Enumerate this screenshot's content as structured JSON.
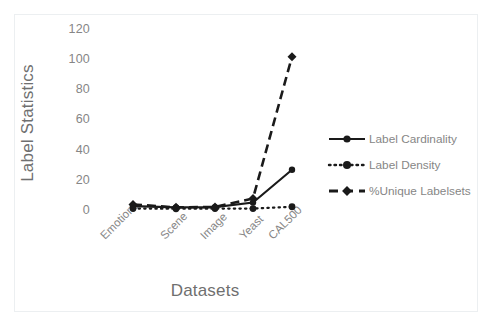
{
  "chart_data": {
    "type": "line",
    "title": "",
    "xlabel": "Datasets",
    "ylabel": "Label Statistics",
    "categories": [
      "Emotions",
      "Scene",
      "Image",
      "Yeast",
      "CAL500"
    ],
    "yticks": [
      0,
      20,
      40,
      60,
      80,
      100,
      120
    ],
    "ylim": [
      0,
      120
    ],
    "grid": false,
    "legend_position": "right",
    "series": [
      {
        "name": "Label Cardinality",
        "style": "solid",
        "marker": "circle",
        "color": "#1a1a1a",
        "values": [
          1.9,
          1.07,
          1.24,
          4.24,
          26.04
        ]
      },
      {
        "name": "Label Density",
        "style": "dotted",
        "marker": "circle",
        "color": "#1a1a1a",
        "values": [
          0.31,
          0.18,
          0.25,
          0.3,
          1.5
        ]
      },
      {
        "name": "%Unique Labelsets",
        "style": "dashed",
        "marker": "diamond",
        "color": "#1a1a1a",
        "values": [
          3.0,
          1.1,
          1.3,
          7.0,
          101.0
        ]
      }
    ]
  },
  "axes": {
    "y_title": "Label Statistics",
    "x_title": "Datasets",
    "y_tick_labels": [
      "120",
      "100",
      "80",
      "60",
      "40",
      "20",
      "0"
    ],
    "x_tick_labels": [
      "Emotions",
      "Scene",
      "Image",
      "Yeast",
      "CAL500"
    ]
  },
  "legend": {
    "items": [
      {
        "label": "Label Cardinality"
      },
      {
        "label": "Label Density"
      },
      {
        "label": "%Unique Labelsets"
      }
    ]
  },
  "colors": {
    "series": "#1a1a1a",
    "text": "#868686",
    "title_text": "#6f6f6f",
    "frame": "#eceff1",
    "background": "#ffffff"
  }
}
